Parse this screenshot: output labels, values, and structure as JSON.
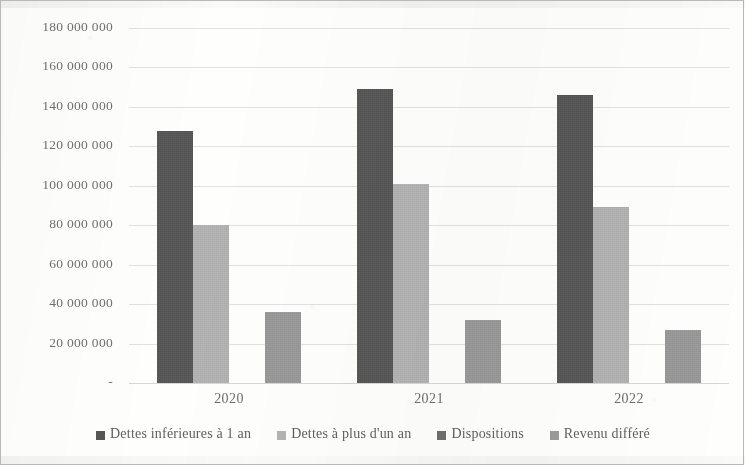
{
  "chart_data": {
    "type": "bar",
    "title": "",
    "subtitle": "",
    "xlabel": "",
    "ylabel": "",
    "categories": [
      "2020",
      "2021",
      "2022"
    ],
    "series": [
      {
        "name": "Dettes inférieures à 1 an",
        "color": "#565656",
        "values": [
          128000000,
          149000000,
          146000000
        ]
      },
      {
        "name": "Dettes à plus d'un an",
        "color": "#b4b4b4",
        "values": [
          80000000,
          101000000,
          89000000
        ]
      },
      {
        "name": "Dispositions",
        "color": "#6f6f6f",
        "values": [
          0,
          0,
          0
        ]
      },
      {
        "name": "Revenu différé",
        "color": "#9a9a9a",
        "values": [
          36000000,
          32000000,
          27000000
        ]
      }
    ],
    "ylim": [
      0,
      180000000
    ],
    "y_tick_values": [
      0,
      20000000,
      40000000,
      60000000,
      80000000,
      100000000,
      120000000,
      140000000,
      160000000,
      180000000
    ],
    "y_tick_labels": [
      "-",
      "20 000 000",
      "40 000 000",
      "60 000 000",
      "80 000 000",
      "100 000 000",
      "120 000 000",
      "140 000 000",
      "160 000 000",
      "180 000 000"
    ],
    "grid": true,
    "grid_axis": "y",
    "legend_position": "bottom",
    "legend_entries": [
      "Dettes inférieures à 1 an",
      "Dettes à plus d'un an",
      "Dispositions",
      "Revenu différé"
    ],
    "annotations": [],
    "border": true
  },
  "colors": {
    "series_1": "#565656",
    "series_2": "#b4b4b4",
    "series_3": "#6f6f6f",
    "series_4": "#9a9a9a",
    "gridline": "#dcdcda",
    "text": "#6f6f6d",
    "frame": "#b9b9b6",
    "background": "#fefefd"
  }
}
